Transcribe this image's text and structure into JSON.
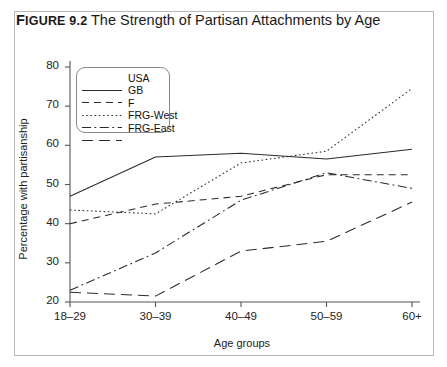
{
  "figure": {
    "label_prefix": "F",
    "label_caps": "IGURE",
    "label_number": " 9.2",
    "title_text": " The Strength of Partisan Attachments by Age"
  },
  "chart_data": {
    "type": "line",
    "title": "The Strength of Partisan Attachments by Age",
    "xlabel": "Age groups",
    "ylabel": "Percentage with partisanship",
    "categories": [
      "18–29",
      "30–39",
      "40–49",
      "50–59",
      "60+"
    ],
    "ylim": [
      20,
      80
    ],
    "yticks": [
      20,
      30,
      40,
      50,
      60,
      70,
      80
    ],
    "grid": false,
    "legend_position": "top-left inside",
    "series": [
      {
        "name": "USA",
        "style": "solid",
        "values": [
          47.0,
          57.0,
          58.0,
          56.5,
          59.0
        ]
      },
      {
        "name": "GB",
        "style": "dashed",
        "values": [
          40.0,
          45.0,
          47.0,
          52.5,
          52.5
        ]
      },
      {
        "name": "F",
        "style": "dotted",
        "values": [
          43.5,
          42.5,
          55.5,
          58.5,
          74.5
        ]
      },
      {
        "name": "FRG-West",
        "style": "dashdot",
        "values": [
          23.0,
          32.5,
          46.0,
          53.0,
          49.0
        ]
      },
      {
        "name": "FRG-East",
        "style": "longdash",
        "values": [
          22.5,
          21.5,
          33.0,
          35.5,
          45.5
        ]
      }
    ]
  },
  "legend": {
    "items": [
      {
        "label": "USA"
      },
      {
        "label": "GB"
      },
      {
        "label": "F"
      },
      {
        "label": "FRG-West"
      },
      {
        "label": "FRG-East"
      }
    ]
  }
}
